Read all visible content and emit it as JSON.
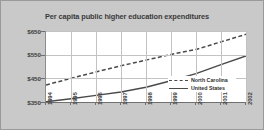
{
  "chart_data": {
    "type": "line",
    "title": "Per capita public higher education expenditures",
    "xlabel": "",
    "ylabel": "",
    "x": [
      "1994",
      "1995",
      "1996",
      "1997",
      "1998",
      "1999",
      "2000",
      "2001",
      "2002"
    ],
    "categories": [
      "1994",
      "1995",
      "1996",
      "1997",
      "1998",
      "1999",
      "2000",
      "2001",
      "2002"
    ],
    "series": [
      {
        "name": "North Carolina",
        "style": "dashed",
        "color": "#4a4a4a",
        "values": [
          422,
          450,
          477,
          503,
          527,
          551,
          572,
          604,
          636
        ]
      },
      {
        "name": "United States",
        "style": "solid",
        "color": "#4a4a4a",
        "values": [
          351,
          364,
          378,
          392,
          412,
          440,
          470,
          508,
          545
        ]
      }
    ],
    "ylim": [
      350,
      650
    ],
    "yticks": [
      350,
      450,
      550,
      650
    ],
    "ytick_labels": [
      "$350",
      "$450",
      "$550",
      "$650"
    ],
    "grid": true,
    "legend_position": "bottom-right"
  },
  "legend": {
    "entries": [
      {
        "label": "North Carolina"
      },
      {
        "label": "United States"
      }
    ]
  },
  "colors": {
    "figure_background": "#c9c9c9",
    "plot_background": "#ffffff",
    "grid": "#c3c3c3",
    "axis": "#6f6f6f",
    "title_text": "#3a3a3a",
    "tick_text": "#3d3d3d",
    "line": "#4a4a4a",
    "border": "#9a9a9a"
  }
}
